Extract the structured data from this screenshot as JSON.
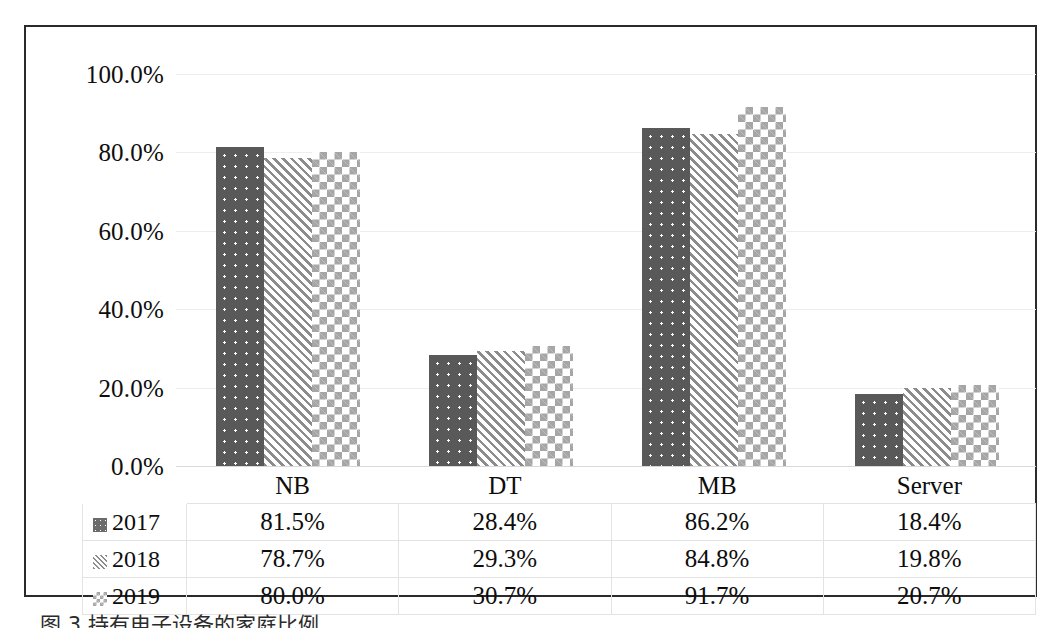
{
  "chart_data": {
    "type": "bar",
    "title": "",
    "xlabel": "",
    "ylabel": "",
    "categories": [
      "NB",
      "DT",
      "MB",
      "Server"
    ],
    "series": [
      {
        "name": "2017",
        "pattern": "dotted-dark-gray",
        "color": "#595959",
        "values": [
          81.5,
          28.4,
          86.2,
          18.4
        ],
        "labels": [
          "81.5%",
          "28.4%",
          "86.2%",
          "18.4%"
        ]
      },
      {
        "name": "2018",
        "pattern": "diagonal-stripes",
        "color": "#8c8c8c",
        "values": [
          78.7,
          29.3,
          84.8,
          19.8
        ],
        "labels": [
          "78.7%",
          "29.3%",
          "84.8%",
          "19.8%"
        ]
      },
      {
        "name": "2019",
        "pattern": "checkerboard",
        "color": "#a6a6a6",
        "values": [
          80.0,
          30.7,
          91.7,
          20.7
        ],
        "labels": [
          "80.0%",
          "30.7%",
          "91.7%",
          "20.7%"
        ]
      }
    ],
    "ylim": [
      0,
      100
    ],
    "yticks": [
      0,
      20,
      40,
      60,
      80,
      100
    ],
    "ytick_labels": [
      "0.0%",
      "20.0%",
      "40.0%",
      "60.0%",
      "80.0%",
      "100.0%"
    ],
    "grid": true,
    "legend_position": "data-table-left-column",
    "data_table_visible": true
  },
  "table": {
    "header_row": [
      "",
      "NB",
      "DT",
      "MB",
      "Server"
    ],
    "rows": [
      {
        "legend": "2017",
        "cells": [
          "81.5%",
          "28.4%",
          "86.2%",
          "18.4%"
        ]
      },
      {
        "legend": "2018",
        "cells": [
          "78.7%",
          "29.3%",
          "84.8%",
          "19.8%"
        ]
      },
      {
        "legend": "2019",
        "cells": [
          "80.0%",
          "30.7%",
          "91.7%",
          "20.7%"
        ]
      }
    ]
  },
  "caption": {
    "text": "图 3 持有电子设备的家庭比例"
  }
}
